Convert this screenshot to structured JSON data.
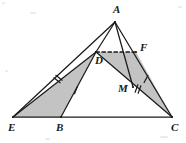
{
  "figure": {
    "type": "geometry-diagram",
    "width": 186,
    "height": 143,
    "background_color": "#ffffff",
    "stroke_color": "#1a1a1a",
    "shade_color": "#b8b8b8",
    "shade_opacity": 0.85,
    "points": {
      "A": {
        "x": 115,
        "y": 22,
        "label": "A",
        "label_x": 113,
        "label_y": 13
      },
      "E": {
        "x": 13,
        "y": 117,
        "label": "E",
        "label_x": 8,
        "label_y": 131
      },
      "C": {
        "x": 172,
        "y": 117,
        "label": "C",
        "label_x": 171,
        "label_y": 131
      },
      "B": {
        "x": 61,
        "y": 117,
        "label": "B",
        "label_x": 56,
        "label_y": 131
      },
      "D": {
        "x": 96,
        "y": 52,
        "label": "D",
        "label_x": 95,
        "label_y": 64
      },
      "F": {
        "x": 136,
        "y": 52,
        "label": "F",
        "label_x": 140,
        "label_y": 51
      },
      "M": {
        "x": 133,
        "y": 87,
        "label": "M",
        "label_x": 118,
        "label_y": 92
      }
    },
    "segments": [
      {
        "name": "side-AE",
        "from": "A",
        "to": "E",
        "style": "solid"
      },
      {
        "name": "side-AC",
        "from": "A",
        "to": "C",
        "style": "solid"
      },
      {
        "name": "base-EC",
        "from": "E",
        "to": "C",
        "style": "solid"
      },
      {
        "name": "cevian-AD",
        "from": "A",
        "to": "D",
        "style": "solid"
      },
      {
        "name": "cevian-AM",
        "from": "A",
        "to": "M",
        "style": "solid"
      },
      {
        "name": "segment-ED",
        "from": "E",
        "to": "D",
        "style": "solid"
      },
      {
        "name": "segment-DB",
        "from": "D",
        "to": "B",
        "style": "solid"
      },
      {
        "name": "segment-DC",
        "from": "D",
        "to": "C",
        "style": "solid"
      },
      {
        "name": "segment-DF",
        "from": "D",
        "to": "F",
        "style": "dashed"
      }
    ],
    "shaded_regions": [
      {
        "name": "triangle-EBD",
        "vertices": [
          "E",
          "B",
          "D"
        ]
      },
      {
        "name": "region-DFC",
        "vertices": [
          "D",
          "F",
          "C"
        ]
      }
    ],
    "tick_marks": [
      {
        "name": "tick-ED-double",
        "x": 58,
        "y": 79,
        "count": 2,
        "angle": -52
      },
      {
        "name": "tick-DB-single",
        "x": 76,
        "y": 90,
        "count": 1,
        "angle": 22
      },
      {
        "name": "tick-FC-single",
        "x": 146,
        "y": 79,
        "count": 1,
        "angle": 28
      },
      {
        "name": "tick-MC-double",
        "x": 138,
        "y": 89,
        "count": 2,
        "angle": 20
      }
    ],
    "specks": [
      {
        "x": 2,
        "y": 2,
        "w": 3,
        "h": 2
      },
      {
        "x": 178,
        "y": 6,
        "w": 4,
        "h": 2
      },
      {
        "x": 30,
        "y": 12,
        "w": 6,
        "h": 2
      },
      {
        "x": 160,
        "y": 136,
        "w": 8,
        "h": 2
      },
      {
        "x": 45,
        "y": 138,
        "w": 5,
        "h": 2
      },
      {
        "x": 5,
        "y": 70,
        "w": 3,
        "h": 2
      }
    ]
  }
}
